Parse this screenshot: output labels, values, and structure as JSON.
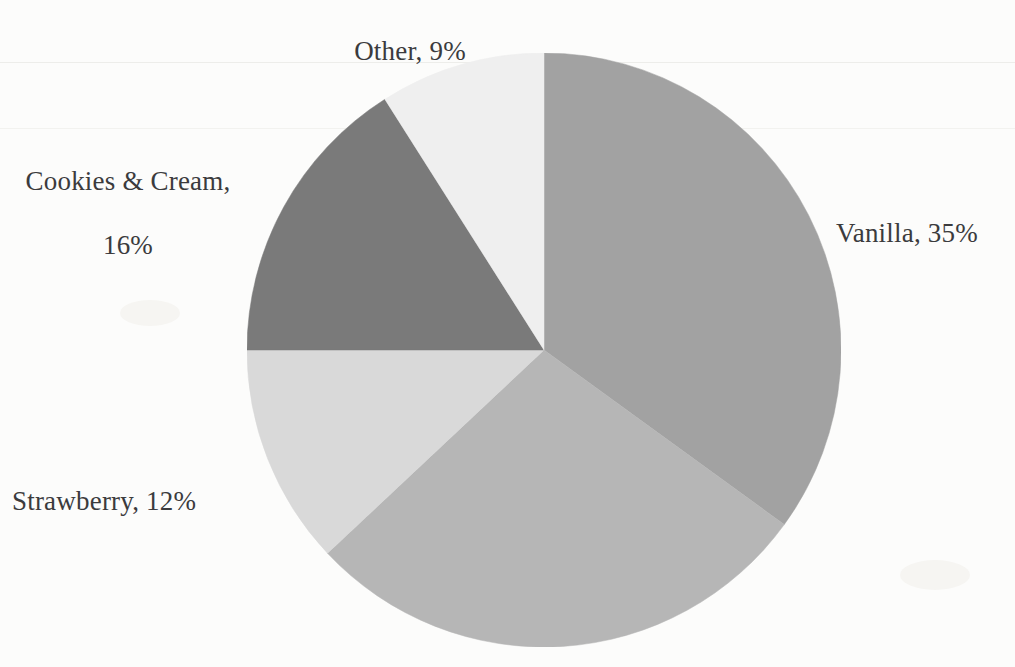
{
  "chart_data": {
    "type": "pie",
    "title": "",
    "subtitle": "",
    "xlabel": "",
    "ylabel": "",
    "legend_position": "none",
    "grid": false,
    "start_angle_deg": 0,
    "direction": "clockwise",
    "categories": [
      "Vanilla",
      "Chocolate",
      "Strawberry",
      "Cookies & Cream",
      "Other"
    ],
    "values": [
      35,
      28,
      12,
      16,
      9
    ],
    "colors": [
      "#a2a2a2",
      "#b6b6b6",
      "#d9d9d9",
      "#7a7a7a",
      "#efefef"
    ],
    "slices": [
      {
        "name": "Vanilla",
        "value": 35,
        "label_text": "Vanilla, 35%",
        "label_visible": true,
        "color": "#a2a2a2",
        "start_deg": 0,
        "end_deg": 126
      },
      {
        "name": "Chocolate",
        "value": 28,
        "label_text": "",
        "label_visible": false,
        "color": "#b6b6b6",
        "start_deg": 126,
        "end_deg": 226.8
      },
      {
        "name": "Strawberry",
        "value": 12,
        "label_text": "Strawberry, 12%",
        "label_visible": true,
        "color": "#d9d9d9",
        "start_deg": 226.8,
        "end_deg": 270
      },
      {
        "name": "Cookies & Cream",
        "value": 16,
        "label_text": "Cookies & Cream,\n16%",
        "label_visible": true,
        "color": "#7a7a7a",
        "start_deg": 270,
        "end_deg": 327.6
      },
      {
        "name": "Other",
        "value": 9,
        "label_text": "Other, 9%",
        "label_visible": true,
        "color": "#efefef",
        "start_deg": 327.6,
        "end_deg": 360
      }
    ]
  },
  "labels": {
    "other": "Other, 9%",
    "vanilla": "Vanilla, 35%",
    "cookies_line1": "Cookies & Cream,",
    "cookies_line2": "16%",
    "strawberry": "Strawberry, 12%"
  },
  "geometry": {
    "center_x": 544,
    "center_y": 350,
    "radius": 297
  },
  "colors": {
    "background": "#fcfcfb",
    "text": "#3b3b3d",
    "vanilla": "#a2a2a2",
    "chocolate": "#b6b6b6",
    "strawberry": "#d9d9d9",
    "cookies_and_cream": "#7a7a7a",
    "other": "#efefef"
  }
}
